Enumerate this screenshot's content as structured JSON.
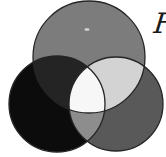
{
  "figure": {
    "caption_fragment": "F",
    "background": "#ffffff",
    "outline": "#262626",
    "colors": {
      "top_circle": "#7c7c7c",
      "left_circle": "#0c0c0c",
      "right_circle": "#595959",
      "top_left_overlap": "#242424",
      "top_right_overlap": "#d3d3d3",
      "left_right_overlap": "#8d8d8d",
      "center_overlap": "#f7f7f7",
      "speck": "#d9d9d9"
    }
  }
}
